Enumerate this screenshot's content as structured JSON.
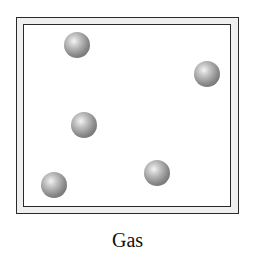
{
  "diagram": {
    "label": "Gas",
    "container": "double-walled box",
    "particles": [
      {
        "cx": 77,
        "cy": 45
      },
      {
        "cx": 207,
        "cy": 74
      },
      {
        "cx": 84,
        "cy": 125
      },
      {
        "cx": 157,
        "cy": 173
      },
      {
        "cx": 54,
        "cy": 185
      }
    ],
    "particle_count": 5,
    "colors": {
      "wall": "#2a2a2a",
      "wall_gap": "#efefef",
      "particle": "#8a8a8a"
    }
  }
}
